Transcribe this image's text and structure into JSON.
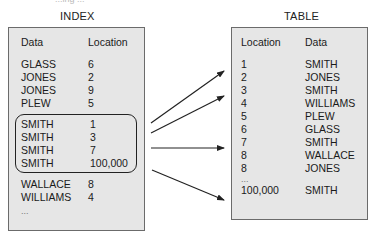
{
  "top_caption_cut": "...ing ...",
  "index": {
    "title": "INDEX",
    "columns": [
      "Data",
      "Location"
    ],
    "rows": [
      {
        "data": "GLASS",
        "location": "6"
      },
      {
        "data": "JONES",
        "location": "2"
      },
      {
        "data": "JONES",
        "location": "9"
      },
      {
        "data": "PLEW",
        "location": "5"
      },
      {
        "data": "SMITH",
        "location": "1"
      },
      {
        "data": "SMITH",
        "location": "3"
      },
      {
        "data": "SMITH",
        "location": "7"
      },
      {
        "data": "SMITH",
        "location": "100,000"
      },
      {
        "data": "WALLACE",
        "location": "8"
      },
      {
        "data": "WILLIAMS",
        "location": "4"
      }
    ],
    "ellipsis": "...",
    "highlighted_rows": "SMITH entries (rows 5-8)"
  },
  "table": {
    "title": "TABLE",
    "columns": [
      "Location",
      "Data"
    ],
    "rows": [
      {
        "location": "1",
        "data": "SMITH"
      },
      {
        "location": "2",
        "data": "JONES"
      },
      {
        "location": "3",
        "data": "SMITH"
      },
      {
        "location": "4",
        "data": "WILLIAMS"
      },
      {
        "location": "5",
        "data": "PLEW"
      },
      {
        "location": "6",
        "data": "GLASS"
      },
      {
        "location": "7",
        "data": "SMITH"
      },
      {
        "location": "8",
        "data": "WALLACE"
      },
      {
        "location": "8",
        "data": "JONES"
      }
    ],
    "ellipsis": "...",
    "last_row": {
      "location": "100,000",
      "data": "SMITH"
    }
  },
  "arrows": [
    {
      "from": "SMITH 1",
      "to": "Location 1"
    },
    {
      "from": "SMITH 3",
      "to": "Location 3"
    },
    {
      "from": "SMITH 7",
      "to": "Location 7"
    },
    {
      "from": "SMITH 100,000",
      "to": "Location 100,000"
    }
  ],
  "colors": {
    "panel_bg": "#e6e6e6",
    "border": "#6b6b6b",
    "arrow": "#222222"
  }
}
